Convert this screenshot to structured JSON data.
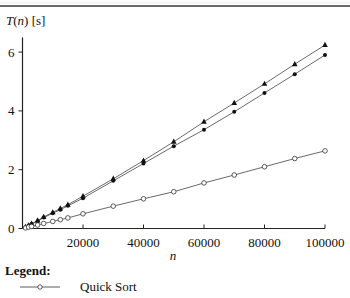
{
  "chart_data": {
    "type": "line",
    "title": "",
    "xlabel": "n",
    "ylabel": "T(n) [s]",
    "ylabel_parts": {
      "func": "T",
      "arg": "n",
      "unit": "[s]"
    },
    "xlim": [
      0,
      100000
    ],
    "ylim": [
      0,
      6.5
    ],
    "x_ticks": [
      20000,
      40000,
      60000,
      80000,
      100000
    ],
    "x_tick_labels": [
      "20000",
      "40000",
      "60000",
      "80000",
      "100000"
    ],
    "y_ticks": [
      0,
      2,
      4,
      6
    ],
    "y_tick_labels": [
      "0",
      "2",
      "4",
      "6"
    ],
    "grid": false,
    "legend_position": "below",
    "x": [
      1000,
      2000,
      3000,
      5000,
      7000,
      10000,
      12500,
      15000,
      20000,
      30000,
      40000,
      50000,
      60000,
      70000,
      80000,
      90000,
      100000
    ],
    "series": [
      {
        "name": "Series A (triangle)",
        "marker": "triangle",
        "values": [
          0.05,
          0.1,
          0.16,
          0.27,
          0.39,
          0.55,
          0.68,
          0.81,
          1.1,
          1.69,
          2.31,
          2.95,
          3.63,
          4.27,
          4.92,
          5.59,
          6.24
        ]
      },
      {
        "name": "Series B (filled circle)",
        "marker": "filled-circle",
        "values": [
          0.05,
          0.1,
          0.15,
          0.25,
          0.37,
          0.52,
          0.64,
          0.77,
          1.03,
          1.62,
          2.21,
          2.8,
          3.36,
          3.97,
          4.61,
          5.25,
          5.9
        ]
      },
      {
        "name": "Quick Sort",
        "marker": "open-circle",
        "values": [
          0.02,
          0.05,
          0.07,
          0.12,
          0.17,
          0.24,
          0.3,
          0.36,
          0.5,
          0.76,
          1.01,
          1.25,
          1.55,
          1.82,
          2.1,
          2.38,
          2.64
        ]
      }
    ]
  },
  "legend": {
    "title": "Legend:",
    "items": [
      {
        "label": "Quick Sort",
        "marker": "open-circle"
      }
    ]
  }
}
